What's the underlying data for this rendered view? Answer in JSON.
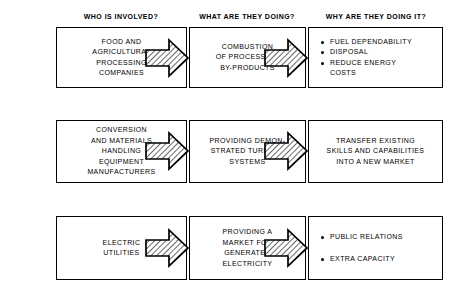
{
  "headers": [
    {
      "label": "WHO IS INVOLVED?"
    },
    {
      "label": "WHAT ARE THEY DOING?"
    },
    {
      "label": "WHY ARE THEY DOING IT?"
    }
  ],
  "rows": [
    {
      "who": "FOOD AND\nAGRICULTURAL\nPROCESSING\nCOMPANIES",
      "what": "COMBUSTION\nOF PROCESSING\nBY-PRODUCTS",
      "why_type": "bullets",
      "why_bullets": [
        "FUEL DEPENDABILITY",
        "DISPOSAL",
        "REDUCE ENERGY\nCOSTS"
      ]
    },
    {
      "who": "CONVERSION\nAND MATERIALS\nHANDLING\nEQUIPMENT\nMANUFACTURERS",
      "what": "PROVIDING DEMON-\nSTRATED TURNKEY\nSYSTEMS",
      "why_type": "text",
      "why": "TRANSFER EXISTING\nSKILLS AND CAPABILITIES\nINTO A NEW MARKET"
    },
    {
      "who": "ELECTRIC\nUTILITIES",
      "what": "PROVIDING A\nMARKET FOR\nGENERATED\nELECTRICITY",
      "why_type": "bullets",
      "why_bullets": [
        "PUBLIC RELATIONS",
        "EXTRA CAPACITY"
      ]
    }
  ],
  "arrows": {
    "icon": "block-arrow-right-hatched",
    "outline_color": "#000000",
    "fill_color": "#ffffff",
    "hatch_color": "#555555"
  },
  "colors": {
    "background": "#ffffff",
    "text": "#000000",
    "box_border": "#000000"
  }
}
